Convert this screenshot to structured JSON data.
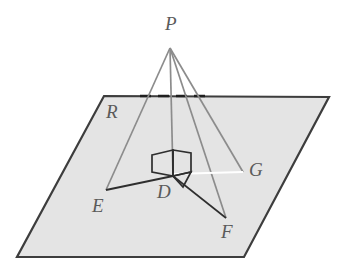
{
  "figure": {
    "type": "geometry-diagram",
    "canvas": {
      "width": 343,
      "height": 270
    },
    "colors": {
      "background": "#ffffff",
      "plane_fill": "#e4e4e4",
      "plane_edge": "#3d3d3d",
      "ray_line": "#8c8c8c",
      "segment_dark": "#2e2e2e",
      "segment_light": "#ffffff",
      "label_text": "#5a5a5a",
      "dashed_edge": "#1f1f1f"
    },
    "plane": {
      "name": "R",
      "corners": [
        {
          "x": 104,
          "y": 96
        },
        {
          "x": 329,
          "y": 97
        },
        {
          "x": 244,
          "y": 257
        },
        {
          "x": 17,
          "y": 257
        }
      ],
      "hidden_top_edge": {
        "x1": 140,
        "y1": 96,
        "x2": 206,
        "y2": 96
      }
    },
    "points": {
      "P": {
        "x": 170,
        "y": 48,
        "label": "P",
        "label_x": 165,
        "label_y": 14
      },
      "D": {
        "x": 173,
        "y": 176,
        "label": "D",
        "label_x": 157,
        "label_y": 182
      },
      "E": {
        "x": 106,
        "y": 190,
        "label": "E",
        "label_x": 92,
        "label_y": 196
      },
      "F": {
        "x": 226,
        "y": 218,
        "label": "F",
        "label_x": 221,
        "label_y": 222
      },
      "G": {
        "x": 243,
        "y": 172,
        "label": "G",
        "label_x": 249,
        "label_y": 160
      },
      "R": {
        "label": "R",
        "label_x": 106,
        "label_y": 102
      }
    },
    "rays_from_apex": [
      {
        "name": "PE",
        "from": "P",
        "to": "E"
      },
      {
        "name": "PD",
        "from": "P",
        "to": "D"
      },
      {
        "name": "PG",
        "from": "P",
        "to": "G"
      },
      {
        "name": "PF",
        "from": "P",
        "to": "F"
      }
    ],
    "in_plane_segments": [
      {
        "name": "DE",
        "from": "D",
        "to": "E",
        "style": "dark"
      },
      {
        "name": "DF",
        "from": "D",
        "to": "F",
        "style": "dark"
      },
      {
        "name": "DG",
        "from": "D",
        "to": "G",
        "style": "light"
      }
    ],
    "right_angle_marker": {
      "description": "double-square perpendicular marker at D indicating PD is perpendicular to plane R",
      "left_face": [
        {
          "x": 152,
          "y": 155
        },
        {
          "x": 173,
          "y": 150
        },
        {
          "x": 173,
          "y": 176
        },
        {
          "x": 152,
          "y": 172
        }
      ],
      "right_face": [
        {
          "x": 173,
          "y": 150
        },
        {
          "x": 191,
          "y": 153
        },
        {
          "x": 191,
          "y": 172
        },
        {
          "x": 173,
          "y": 176
        }
      ],
      "lower_tab": [
        {
          "x": 173,
          "y": 176
        },
        {
          "x": 191,
          "y": 172
        },
        {
          "x": 183,
          "y": 187
        }
      ]
    }
  }
}
